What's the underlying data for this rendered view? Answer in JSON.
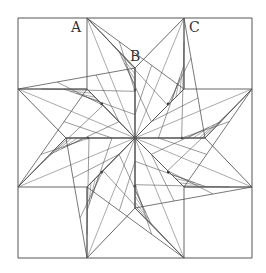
{
  "diagram": {
    "labels": [
      {
        "text": "A",
        "x": 71,
        "y": 20
      },
      {
        "text": "B",
        "x": 130,
        "y": 49
      },
      {
        "text": "C",
        "x": 189,
        "y": 20
      }
    ],
    "frame": {
      "x1": 18,
      "y1": 18,
      "x2": 252,
      "y2": 258
    },
    "center": {
      "x": 135,
      "y": 138
    },
    "corner_square_size": {
      "w": 69,
      "h": 70
    },
    "star_radius_inner": 46,
    "star_radius_outer": 120,
    "stroke_color": "#555555",
    "node_color": "#222222"
  }
}
